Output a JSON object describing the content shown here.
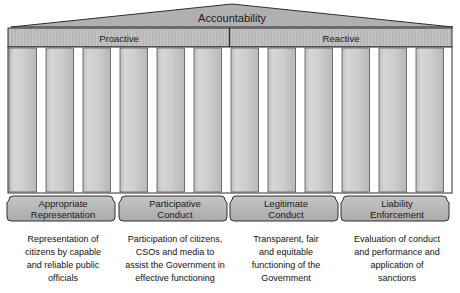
{
  "diagram": {
    "type": "temple-pillars",
    "pediment": {
      "label": "Accountability"
    },
    "frieze": {
      "segments": [
        {
          "id": "proactive",
          "label": "Proactive"
        },
        {
          "id": "reactive",
          "label": "Reactive"
        }
      ]
    },
    "colors": {
      "fill": "#b3b3b3",
      "pillar_fill": "#c9c9c9",
      "pillar_light": "#dcdcdc",
      "stroke": "#2b2b2b",
      "text": "#1a1a1a",
      "background": "#ffffff"
    },
    "pillar_count": 12,
    "pillars": [
      {
        "title_line1": "Appropriate",
        "title_line2": "Representation",
        "caption": [
          "Representation of",
          "citizens by capable",
          "and reliable public",
          "officials"
        ]
      },
      {
        "title_line1": "Participative",
        "title_line2": "Conduct",
        "caption": [
          "Participation of citizens,",
          "CSOs and media to",
          "assist the Government in",
          "effective functioning"
        ]
      },
      {
        "title_line1": "Legitimate",
        "title_line2": "Conduct",
        "caption": [
          "Transparent, fair",
          "and equitable",
          "functioning of the",
          "Government"
        ]
      },
      {
        "title_line1": "Liability",
        "title_line2": "Enforcement",
        "caption": [
          "Evaluation of conduct",
          "and performance and",
          "application of",
          "sanctions"
        ]
      }
    ]
  }
}
